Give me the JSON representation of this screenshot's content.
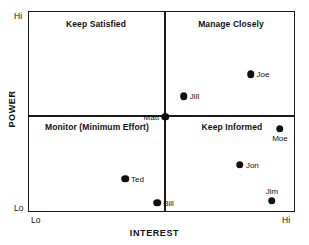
{
  "chart_data": {
    "type": "scatter",
    "title": "",
    "xlabel": "INTEREST",
    "ylabel": "POWER",
    "xlim": [
      0,
      100
    ],
    "ylim": [
      0,
      100
    ],
    "grid": false,
    "legend": "none",
    "x_tick_labels": [
      "Lo",
      "Hi"
    ],
    "y_tick_labels": [
      "Lo",
      "Hi"
    ],
    "quadrants": [
      {
        "id": "top-left",
        "label": "Manage Closely_placeholder"
      }
    ],
    "points": [
      {
        "name": "Joe",
        "x": 83,
        "y": 69,
        "label_pos": "right"
      },
      {
        "name": "Jill",
        "x": 58,
        "y": 58,
        "label_pos": "right"
      },
      {
        "name": "Matt",
        "x": 51,
        "y": 48,
        "label_pos": "left"
      },
      {
        "name": "Moe",
        "x": 94,
        "y": 42,
        "label_pos": "below"
      },
      {
        "name": "Jon",
        "x": 79,
        "y": 24,
        "label_pos": "right"
      },
      {
        "name": "Ted",
        "x": 36,
        "y": 17,
        "label_pos": "right"
      },
      {
        "name": "Jim",
        "x": 91,
        "y": 6,
        "label_pos": "above"
      },
      {
        "name": "Bill",
        "x": 48,
        "y": 5,
        "label_pos": "right"
      }
    ],
    "series": [
      {
        "name": "Stakeholders",
        "x": [
          83,
          58,
          51,
          94,
          79,
          36,
          91,
          48
        ],
        "y": [
          69,
          58,
          48,
          42,
          24,
          17,
          6,
          5
        ],
        "point_labels": [
          "Joe",
          "Jill",
          "Matt",
          "Moe",
          "Jon",
          "Ted",
          "Jim",
          "Bill"
        ]
      }
    ]
  },
  "axes": {
    "x_title": "INTEREST",
    "y_title": "POWER",
    "x_low": "Lo",
    "x_high": "Hi",
    "y_low": "Lo",
    "y_high": "Hi"
  },
  "quadrant_labels": {
    "top_left": "Keep Satisfied",
    "top_right": "Manage Closely",
    "bottom_left": "Monitor (Minimum Effort)",
    "bottom_right": "Keep Informed"
  },
  "points": [
    {
      "name": "Joe"
    },
    {
      "name": "Jill"
    },
    {
      "name": "Matt"
    },
    {
      "name": "Moe"
    },
    {
      "name": "Jon"
    },
    {
      "name": "Ted"
    },
    {
      "name": "Jim"
    },
    {
      "name": "Bill"
    }
  ],
  "colors": {
    "frame": "#1a1a1a",
    "point": "#111111",
    "background": "#ffffff",
    "text": "#111111"
  }
}
